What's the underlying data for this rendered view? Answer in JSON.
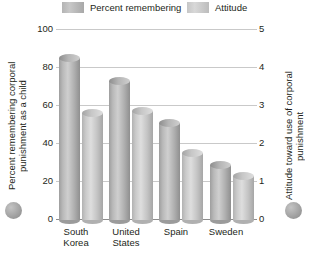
{
  "chart_data": {
    "type": "bar",
    "title": "",
    "categories": [
      "South Korea",
      "United States",
      "Spain",
      "Sweden"
    ],
    "series": [
      {
        "name": "Percent remembering",
        "axis": "left",
        "color": "#b4b4b4",
        "values": [
          87,
          75,
          53,
          31
        ]
      },
      {
        "name": "Attitude",
        "axis": "right",
        "color": "#cfcfcf",
        "values": [
          2.9,
          2.95,
          1.85,
          1.25
        ]
      }
    ],
    "xlabel": "",
    "ylabel": "Percent remembering corporal punishment as a child",
    "y2label": "Attitude toward use of corporal punishment",
    "ylim": [
      0,
      100
    ],
    "y2lim": [
      0,
      5
    ],
    "yticks": [
      "0",
      "20",
      "40",
      "60",
      "80",
      "100"
    ],
    "y2ticks": [
      "0",
      "1",
      "2",
      "3",
      "4",
      "5"
    ],
    "grid": true,
    "legend_position": "top"
  },
  "legend": {
    "items": [
      {
        "label": "Percent remembering",
        "swatch": "series-1-swatch"
      },
      {
        "label": "Attitude",
        "swatch": "series-2-swatch"
      }
    ]
  },
  "axes": {
    "left_title": "Percent remembering corporal punishment as a child",
    "right_title": "Attitude toward use of corporal punishment",
    "left_ticks": [
      "100",
      "80",
      "60",
      "40",
      "20",
      "0"
    ],
    "right_ticks": [
      "5",
      "4",
      "3",
      "2",
      "1",
      "0"
    ]
  },
  "categories": [
    {
      "line1": "South",
      "line2": "Korea"
    },
    {
      "line1": "United",
      "line2": "States"
    },
    {
      "line1": "Spain",
      "line2": ""
    },
    {
      "line1": "Sweden",
      "line2": ""
    }
  ]
}
